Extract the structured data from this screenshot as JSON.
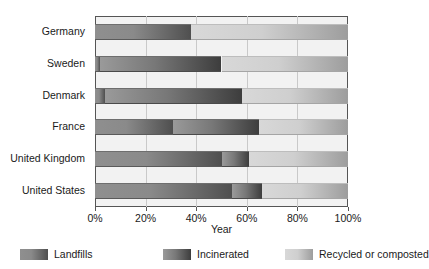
{
  "chart_data": {
    "type": "bar",
    "orientation": "horizontal",
    "stacked": true,
    "normalized": true,
    "title": "",
    "xlabel": "Year",
    "ylabel": "",
    "xlim": [
      0,
      100
    ],
    "xticks": [
      0,
      20,
      40,
      60,
      80,
      100
    ],
    "xtick_labels": [
      "0%",
      "20%",
      "40%",
      "60%",
      "80%",
      "100%"
    ],
    "grid": true,
    "grid_axis": "x",
    "legend_position": "bottom",
    "categories": [
      "Germany",
      "Sweden",
      "Denmark",
      "France",
      "United Kingdom",
      "United States"
    ],
    "series": [
      {
        "name": "Landfills",
        "color": "#8a8a8a",
        "values": [
          38,
          2,
          4,
          31,
          50,
          54
        ]
      },
      {
        "name": "Incinerated",
        "color": "#5a5a5a",
        "values": [
          0,
          48,
          54,
          34,
          11,
          12
        ]
      },
      {
        "name": "Recycled or composted",
        "color": "#c8c8c8",
        "values": [
          62,
          50,
          42,
          35,
          39,
          34
        ]
      }
    ]
  },
  "axes": {
    "x_title": "Year",
    "tick_labels": [
      "0%",
      "20%",
      "40%",
      "60%",
      "80%",
      "100%"
    ],
    "category_labels": [
      "Germany",
      "Sweden",
      "Denmark",
      "France",
      "United Kingdom",
      "United States"
    ]
  },
  "legend": {
    "items": [
      {
        "label": "Landfills",
        "color": "#8a8a8a"
      },
      {
        "label": "Incinerated",
        "color": "#5a5a5a"
      },
      {
        "label": "Recycled or composted",
        "color": "#c8c8c8"
      }
    ]
  },
  "colors": {
    "landfills": "#8a8a8a",
    "incinerated": "#5a5a5a",
    "recycled": "#c8c8c8",
    "plot_background": "#f2f2f2",
    "frame": "#555555",
    "gridline": "#c9c9c9",
    "text": "#1a1a1a"
  }
}
